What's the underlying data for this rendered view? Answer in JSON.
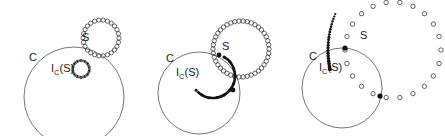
{
  "figure": {
    "type": "diagram",
    "background_color": "#ffffff",
    "stroke_color": "#555555",
    "ink_color": "#1a1a1a",
    "width": 445,
    "height": 136
  },
  "panels": [
    {
      "id": "panel-1",
      "caption": "",
      "circle_C": {
        "label": "C",
        "cx": 74,
        "cy": 97,
        "r": 50,
        "label_x": 29,
        "label_y": 61
      },
      "set_S": {
        "label": "S",
        "cx": 101,
        "cy": 38,
        "r": 18,
        "marker": "open-circle",
        "marker_count": 26,
        "marker_radius": 2.1,
        "label_x": 82,
        "label_y": 41
      },
      "image_IC_S": {
        "label": "I",
        "label_sub": "C",
        "label_arg": "(S)",
        "cx": 81,
        "cy": 69,
        "r": 8.5,
        "style": "thick-ring",
        "label_x": 51,
        "label_y": 72
      },
      "dots_overlay": {
        "count": 14,
        "cx": 81,
        "cy": 69,
        "r": 8.5
      }
    },
    {
      "id": "panel-2",
      "caption": "",
      "circle_C": {
        "label": "C",
        "cx": 199,
        "cy": 93,
        "r": 41,
        "label_x": 166,
        "label_y": 62
      },
      "set_S": {
        "label": "S",
        "cx": 241,
        "cy": 49,
        "r": 28,
        "marker": "open-circle",
        "marker_count": 42,
        "marker_radius": 2.2,
        "label_x": 222,
        "label_y": 50
      },
      "image_IC_S": {
        "label": "I",
        "label_sub": "C",
        "label_arg": "(S)",
        "cx": 213,
        "cy": 76,
        "r": 22,
        "style": "thick-arc",
        "arc_start_deg": 300,
        "arc_end_deg": 135,
        "label_x": 176,
        "label_y": 76
      },
      "dotted_arc": {
        "marker": "filled-dot",
        "count": 11,
        "cx": 213,
        "cy": 76,
        "r": 22,
        "start_deg": 300,
        "end_deg": 140
      },
      "intersection_points": [
        {
          "x": 219,
          "y": 55
        },
        {
          "x": 233,
          "y": 90
        }
      ]
    },
    {
      "id": "panel-3",
      "caption": "",
      "circle_C": {
        "label": "C",
        "cx": 342,
        "cy": 88,
        "r": 40,
        "label_x": 309,
        "label_y": 60
      },
      "set_S": {
        "label": "S",
        "cx": 393,
        "cy": 50,
        "r": 48,
        "marker": "open-circle",
        "marker_count": 22,
        "marker_radius": 2.2,
        "label_x": 360,
        "label_y": 39
      },
      "image_IC_S": {
        "label": "I",
        "label_sub": "C",
        "label_arg": "(S)",
        "style": "dotted-arc",
        "label_x": 319,
        "label_y": 71
      },
      "inner_arc": {
        "marker": "filled-dot",
        "count": 22,
        "cx": 420,
        "cy": 50,
        "r": 92,
        "start_deg": 168,
        "end_deg": 203
      },
      "intersection_points": [
        {
          "x": 345,
          "y": 48
        },
        {
          "x": 380,
          "y": 96
        }
      ]
    }
  ],
  "labels": {
    "circle_C": "C",
    "set_S": "S",
    "image_main": "I",
    "image_sub": "C",
    "image_arg": "(S)"
  }
}
